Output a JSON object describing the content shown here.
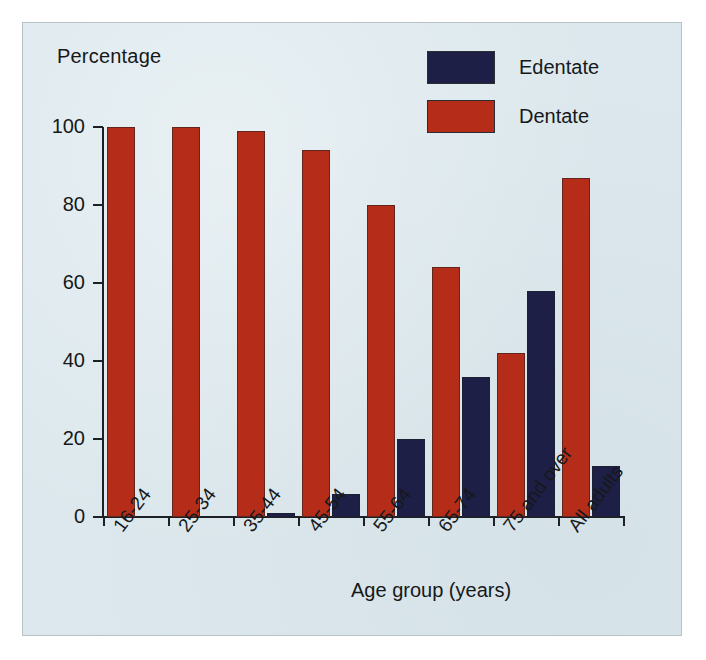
{
  "figure": {
    "background_color": "#dce8ed",
    "border_color": "#b9c3c7"
  },
  "legend": {
    "position": "top-right",
    "entries": [
      {
        "label": "Edentate",
        "color": "#1e1f47",
        "swatch_name": "legend-swatch-edentate"
      },
      {
        "label": "Dentate",
        "color": "#b52d19",
        "swatch_name": "legend-swatch-dentate"
      }
    ]
  },
  "axes": {
    "y_title": "Percentage",
    "x_title": "Age group (years)",
    "y_ticks": [
      "0",
      "20",
      "40",
      "60",
      "80",
      "100"
    ]
  },
  "chart_data": {
    "type": "bar",
    "title": "",
    "subtitle": "",
    "xlabel": "Age group (years)",
    "ylabel": "Percentage",
    "ylim": [
      0,
      100
    ],
    "ytick_values": [
      0,
      20,
      40,
      60,
      80,
      100
    ],
    "grid": false,
    "legend_position": "top-right",
    "categories": [
      "16-24",
      "25-34",
      "35-44",
      "45-54",
      "55-64",
      "65-74",
      "75 and over",
      "All adults"
    ],
    "series": [
      {
        "name": "Edentate",
        "color": "#1e1f47",
        "values": [
          0,
          0,
          1,
          6,
          20,
          36,
          58,
          13
        ]
      },
      {
        "name": "Dentate",
        "color": "#b52d19",
        "values": [
          100,
          100,
          99,
          94,
          80,
          64,
          42,
          87
        ]
      }
    ],
    "series_order_in_group": [
      "Dentate",
      "Edentate"
    ]
  }
}
